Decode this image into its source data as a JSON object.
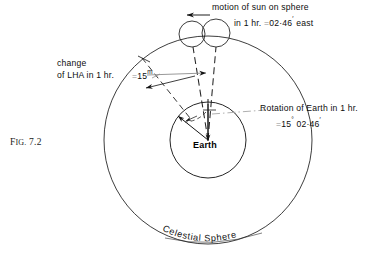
{
  "figure": {
    "number_prefix": "F",
    "number_rest": "IG",
    "number": "Fig. 7.2",
    "number_small": "IG.",
    "number_value": "7.2"
  },
  "labels": {
    "sun_motion_line1": "motion of sun on sphere",
    "sun_motion_line2_pre": "in 1 hr. ",
    "sun_motion_line2_eq": "=",
    "sun_motion_line2_post": "02·46",
    "sun_motion_line2_tail": " east",
    "lha_line1": "change",
    "lha_line2": "of LHA in 1 hr.",
    "lha_eq": "=",
    "lha_value": "15",
    "lha_value_sup": "m",
    "rotation_line1": "Rotation of Earth in 1 hr.",
    "rotation_line2_eq": "=",
    "rotation_line2_deg": "15",
    "rotation_line2_deg_sup": "°",
    "rotation_line2_min": "02·46",
    "rotation_line2_min_sup": "′",
    "earth": "Earth",
    "celestial_sphere": "Celestial Sphere"
  },
  "colors": {
    "ink": "#111111",
    "background": "#ffffff",
    "faint": "#9a9a9a",
    "dash": "#2b2b2b"
  },
  "geometry": {
    "celestial_sphere_center_x": 208,
    "celestial_sphere_center_y": 140,
    "celestial_sphere_radius": 104,
    "earth_center_x": 208,
    "earth_center_y": 140,
    "earth_radius": 38,
    "sun_positions": [
      {
        "name": "sun-after-one-hour",
        "cx": 192,
        "cy": 33,
        "r": 13
      },
      {
        "name": "sun-initial",
        "cx": 216,
        "cy": 33,
        "r": 14
      }
    ],
    "sun_motion_arrow_direction": "west-to-east-label-arrow-points-left",
    "rotation_angle_deg": 15,
    "lha_angle_deg": 15
  },
  "celestial_sphere_arc_text": "Celestial Sphere"
}
